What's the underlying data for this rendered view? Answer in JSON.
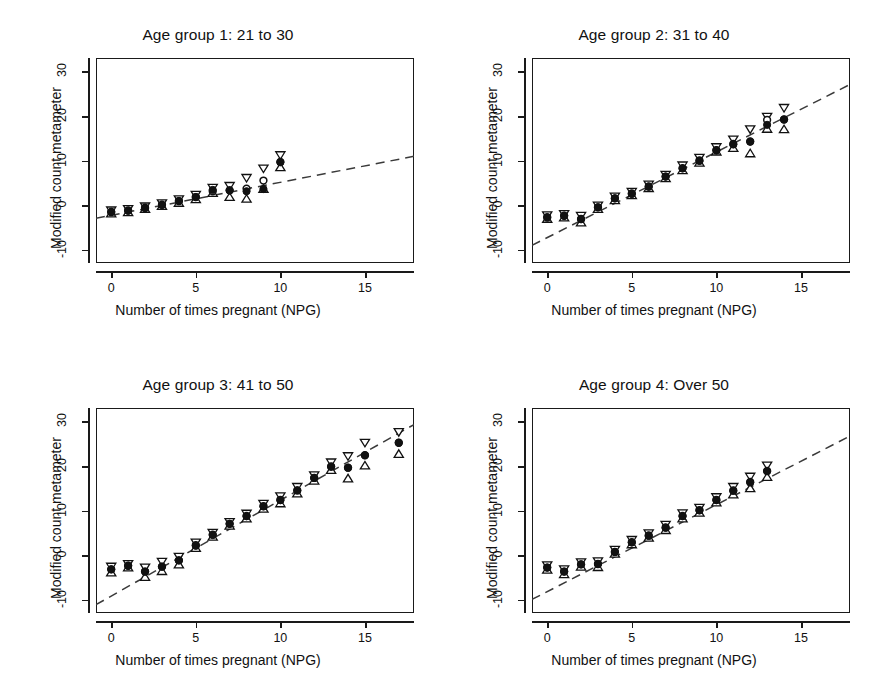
{
  "figure": {
    "axis_titles": {
      "x": "Number of times pregnant (NPG)",
      "y": "Modified count metameter"
    },
    "xticks": [
      0,
      5,
      10,
      15
    ],
    "yticks": [
      -10,
      0,
      10,
      20,
      30
    ],
    "xlim": [
      -0.9,
      17.9
    ],
    "ylim": [
      -13.0,
      33.0
    ],
    "colors": {
      "axis": "#1a1a1a",
      "marker_fill": "#111111",
      "marker_open": "#ffffff",
      "fit_line": "#3a3a3a"
    }
  },
  "chart_data": [
    {
      "type": "scatter",
      "panel_index": 1,
      "title": "Age group 1: 21 to 30",
      "xlabel": "Number of times pregnant (NPG)",
      "ylabel": "Modified count metameter",
      "xlim": [
        -0.9,
        17.9
      ],
      "ylim": [
        -13.0,
        33.0
      ],
      "xticks": [
        0,
        5,
        10,
        15
      ],
      "yticks": [
        -10,
        0,
        10,
        20,
        30
      ],
      "grid": false,
      "legend": "none",
      "fit_line": {
        "style": "dashed",
        "intercept": -2.3,
        "slope": 0.74,
        "x_from": -0.9,
        "x_to": 17.9
      },
      "x": [
        0,
        1,
        2,
        3,
        4,
        5,
        6,
        7,
        8,
        9,
        10
      ],
      "observed": [
        -1.5,
        -1.3,
        -0.7,
        0.0,
        0.9,
        1.8,
        3.4,
        3.3,
        3.1,
        3.6,
        9.6
      ],
      "expected": [
        -1.6,
        -1.2,
        -0.6,
        0.1,
        0.9,
        1.8,
        3.1,
        3.3,
        3.7,
        5.5,
        9.7
      ],
      "ci_upper": [
        -1.0,
        -0.7,
        -0.1,
        0.6,
        1.5,
        2.5,
        4.1,
        4.5,
        6.3,
        8.4,
        11.4
      ],
      "ci_lower": [
        -2.1,
        -1.8,
        -1.1,
        -0.4,
        0.3,
        1.1,
        2.5,
        1.6,
        1.2,
        3.4,
        8.3
      ]
    },
    {
      "type": "scatter",
      "panel_index": 2,
      "title": "Age group 2: 31 to 40",
      "xlabel": "Number of times pregnant (NPG)",
      "ylabel": "Modified count metameter",
      "xlim": [
        -0.9,
        17.9
      ],
      "ylim": [
        -13.0,
        33.0
      ],
      "xticks": [
        0,
        5,
        10,
        15
      ],
      "yticks": [
        -10,
        0,
        10,
        20,
        30
      ],
      "grid": false,
      "legend": "none",
      "fit_line": {
        "style": "dashed",
        "intercept": -7.3,
        "slope": 1.92,
        "x_from": -0.9,
        "x_to": 17.9
      },
      "x": [
        0,
        1,
        2,
        3,
        4,
        5,
        6,
        7,
        8,
        9,
        10,
        11,
        12,
        13,
        14
      ],
      "observed": [
        -2.7,
        -2.4,
        -3.2,
        -0.5,
        1.5,
        2.5,
        4.1,
        6.4,
        8.2,
        9.9,
        12.3,
        13.6,
        14.2,
        18.0,
        19.2
      ],
      "expected": [
        -2.8,
        -2.4,
        -3.1,
        -0.5,
        1.5,
        2.6,
        4.2,
        6.4,
        8.3,
        10.0,
        12.3,
        13.7,
        14.3,
        19.1,
        19.2
      ],
      "ci_upper": [
        -2.1,
        -1.8,
        -2.2,
        0.1,
        2.1,
        3.2,
        4.8,
        7.0,
        9.1,
        10.8,
        13.2,
        14.9,
        17.2,
        20.0,
        22.0
      ],
      "ci_lower": [
        -3.3,
        -3.0,
        -4.1,
        -1.1,
        0.9,
        2.0,
        3.6,
        5.8,
        7.6,
        9.3,
        11.8,
        12.6,
        11.4,
        16.9,
        16.8
      ]
    },
    {
      "type": "scatter",
      "panel_index": 3,
      "title": "Age group 3: 41 to 50",
      "xlabel": "Number of times pregnant (NPG)",
      "ylabel": "Modified count metameter",
      "xlim": [
        -0.9,
        17.9
      ],
      "ylim": [
        -13.0,
        33.0
      ],
      "xticks": [
        0,
        5,
        10,
        15
      ],
      "yticks": [
        -10,
        0,
        10,
        20,
        30
      ],
      "grid": false,
      "legend": "none",
      "fit_line": {
        "style": "dashed",
        "intercept": -9.2,
        "slope": 2.15,
        "x_from": -0.9,
        "x_to": 17.9
      },
      "x": [
        0,
        1,
        2,
        3,
        4,
        5,
        6,
        7,
        8,
        9,
        10,
        11,
        12,
        13,
        14,
        15,
        17
      ],
      "observed": [
        -3.2,
        -2.4,
        -3.7,
        -2.6,
        -1.2,
        2.1,
        4.5,
        7.0,
        8.7,
        10.9,
        12.3,
        14.5,
        17.3,
        19.8,
        19.6,
        22.4,
        25.2
      ],
      "expected": [
        -3.2,
        -2.4,
        -3.7,
        -2.6,
        -1.2,
        2.2,
        4.6,
        7.0,
        8.8,
        11.0,
        12.4,
        14.5,
        17.3,
        19.9,
        19.6,
        22.4,
        25.2
      ],
      "ci_upper": [
        -2.4,
        -1.8,
        -2.6,
        -1.3,
        -0.2,
        3.0,
        5.2,
        7.6,
        9.5,
        11.7,
        13.4,
        15.5,
        18.1,
        21.0,
        22.4,
        25.4,
        27.8
      ],
      "ci_lower": [
        -4.1,
        -3.0,
        -5.1,
        -3.8,
        -2.3,
        1.4,
        3.9,
        6.4,
        8.0,
        10.2,
        11.4,
        13.6,
        16.5,
        18.9,
        17.0,
        19.9,
        22.5
      ]
    },
    {
      "type": "scatter",
      "panel_index": 4,
      "title": "Age group 4: Over 50",
      "xlabel": "Number of times pregnant (NPG)",
      "ylabel": "Modified count metameter",
      "xlim": [
        -0.9,
        17.9
      ],
      "ylim": [
        -13.0,
        33.0
      ],
      "xticks": [
        0,
        5,
        10,
        15
      ],
      "yticks": [
        -10,
        0,
        10,
        20,
        30
      ],
      "grid": false,
      "legend": "none",
      "fit_line": {
        "style": "dashed",
        "intercept": -8.2,
        "slope": 1.95,
        "x_from": -0.9,
        "x_to": 17.9
      },
      "x": [
        0,
        1,
        2,
        3,
        4,
        5,
        6,
        7,
        8,
        9,
        10,
        11,
        12,
        13
      ],
      "observed": [
        -2.8,
        -3.7,
        -2.1,
        -2.0,
        0.7,
        2.8,
        4.3,
        6.1,
        8.7,
        10.0,
        12.3,
        14.4,
        16.3,
        18.8
      ],
      "expected": [
        -2.8,
        -3.7,
        -2.1,
        -2.0,
        0.7,
        2.9,
        4.4,
        6.2,
        8.8,
        10.1,
        12.4,
        14.5,
        16.4,
        18.9
      ],
      "ci_upper": [
        -2.1,
        -3.0,
        -1.4,
        -1.2,
        1.4,
        3.6,
        5.1,
        7.0,
        9.6,
        10.8,
        13.2,
        15.5,
        17.8,
        20.3
      ],
      "ci_lower": [
        -3.5,
        -4.5,
        -2.8,
        -2.9,
        0.1,
        2.2,
        3.7,
        5.4,
        8.0,
        9.3,
        11.6,
        13.4,
        14.8,
        17.3
      ]
    }
  ]
}
